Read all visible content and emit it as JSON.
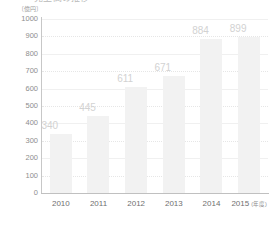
{
  "chart_data": {
    "type": "bar",
    "title": "売上高の推移",
    "title_clipped": true,
    "unit_label": "〔億円〕",
    "categories": [
      "2010",
      "2011",
      "2012",
      "2013",
      "2014",
      "2015"
    ],
    "values": [
      340,
      445,
      611,
      671,
      884,
      899
    ],
    "xlabel": "(年度)",
    "ylabel": "",
    "ylim": [
      0,
      1000
    ],
    "ytick_step": 100,
    "yticks": [
      "0",
      "100",
      "200",
      "300",
      "400",
      "500",
      "600",
      "700",
      "800",
      "900",
      "1000"
    ],
    "grid": true,
    "grid_style": "dotted",
    "legend": null,
    "legend_position": "none",
    "series": [
      {
        "name": "売上高",
        "values": [
          340,
          445,
          611,
          671,
          884,
          899
        ]
      }
    ]
  },
  "colors": {
    "bar_fill": "#f2f2f2",
    "data_label": "#d2d2d2",
    "ytick_text": "#8e8e8e",
    "xtick_text": "#6f6f6f",
    "gridline": "#e6e6e6",
    "axis_line": "#c0c0c0",
    "background": "#ffffff"
  }
}
